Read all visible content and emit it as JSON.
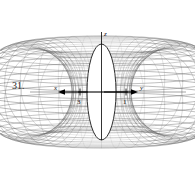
{
  "figure": {
    "problem_number": "31.",
    "caption": "",
    "background_color": "#ffffff",
    "mesh_color": "#555555",
    "axis_color": "#000000",
    "inner_fill_color": "#ffffff"
  },
  "labels": {
    "x_axis": "x",
    "y_axis": "y",
    "z_axis": "z",
    "x_tick": "3",
    "y_tick": "1"
  },
  "chart_data": {
    "type": "line",
    "title": "",
    "subtitle": "",
    "xlabel": "x",
    "ylabel": "y",
    "zlabel": "z",
    "projection": "3d-wireframe-surface",
    "xlim": [
      -3,
      3
    ],
    "ylim": [
      -3,
      3
    ],
    "zlim": [
      -1,
      1
    ],
    "grid": false,
    "legend_position": "none",
    "annotations": [
      {
        "text": "x",
        "role": "axis-arrow-label",
        "direction": "left"
      },
      {
        "text": "y",
        "role": "axis-arrow-label",
        "direction": "right"
      },
      {
        "text": "z",
        "role": "axis-label",
        "direction": "up"
      },
      {
        "text": "3",
        "role": "tick",
        "axis": "x"
      },
      {
        "text": "1",
        "role": "tick",
        "axis": "y"
      }
    ],
    "mesh": {
      "u_lines": 40,
      "v_lines": 18,
      "lobes": 2,
      "symmetry": "bilateral-vertical-and-horizontal"
    },
    "series": [
      {
        "name": "surface-wireframe",
        "values": []
      }
    ]
  }
}
